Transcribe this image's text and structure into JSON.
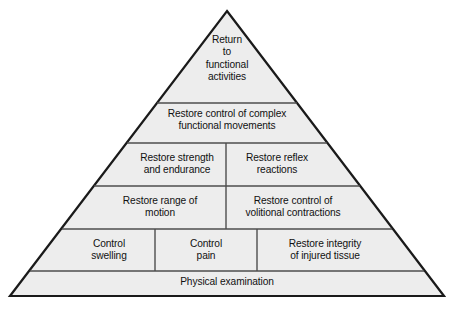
{
  "diagram": {
    "type": "pyramid",
    "title": "",
    "orientation": "apex-up",
    "tier_count": 6,
    "colors": {
      "fill": "#ededed",
      "outline": "#1a1a1a",
      "divider": "#4d4d4d",
      "background": "#ffffff",
      "text": "#111111"
    },
    "geometry": {
      "apex_x": 227,
      "apex_y": 11,
      "base_left_x": 10,
      "base_right_x": 444,
      "base_y": 296,
      "tier_divider_y": [
        103,
        143,
        186,
        229,
        271
      ]
    },
    "tiers": [
      {
        "index": 1,
        "name": "apex-tier",
        "cells": [
          {
            "name": "return-to-functional-activities",
            "text": "Return\nto\nfunctional\nactivities"
          }
        ]
      },
      {
        "index": 2,
        "name": "tier-two",
        "cells": [
          {
            "name": "restore-control-complex-movements",
            "text": "Restore control of complex\nfunctional movements"
          }
        ]
      },
      {
        "index": 3,
        "name": "tier-three",
        "cells": [
          {
            "name": "restore-strength-and-endurance",
            "text": "Restore strength\nand endurance"
          },
          {
            "name": "restore-reflex-reactions",
            "text": "Restore reflex\nreactions"
          }
        ]
      },
      {
        "index": 4,
        "name": "tier-four",
        "cells": [
          {
            "name": "restore-range-of-motion",
            "text": "Restore range of\nmotion"
          },
          {
            "name": "restore-control-volitional-contractions",
            "text": "Restore control of\nvolitional contractions"
          }
        ]
      },
      {
        "index": 5,
        "name": "tier-five",
        "cells": [
          {
            "name": "control-swelling",
            "text": "Control\nswelling"
          },
          {
            "name": "control-pain",
            "text": "Control\npain"
          },
          {
            "name": "restore-integrity-of-injured-tissue",
            "text": "Restore integrity\nof injured tissue"
          }
        ]
      },
      {
        "index": 6,
        "name": "base-tier",
        "cells": [
          {
            "name": "physical-examination",
            "text": "Physical examination"
          }
        ]
      }
    ]
  }
}
